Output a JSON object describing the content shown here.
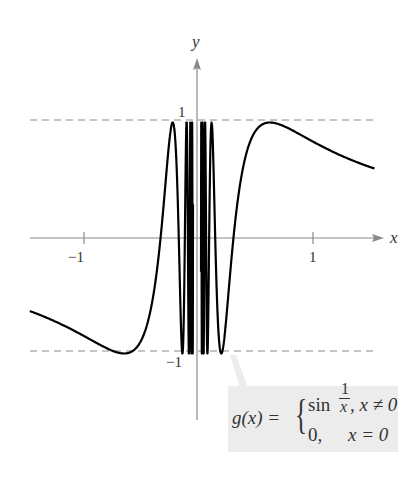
{
  "chart_data": {
    "type": "line",
    "title": "",
    "function": "g(x) = sin(1/x) for x != 0; 0 for x = 0",
    "xlabel": "x",
    "ylabel": "y",
    "xlim": [
      -1.46,
      1.55
    ],
    "ylim": [
      -1.0,
      1.0
    ],
    "x_ticks": [
      -1,
      1
    ],
    "x_tick_labels": [
      "−1",
      "1"
    ],
    "y_ticks": [
      1,
      -1
    ],
    "y_tick_labels": [
      "1",
      "−1"
    ],
    "reference_lines": [
      {
        "y": 1,
        "style": "dashed",
        "color": "#8a8a8a"
      },
      {
        "y": -1,
        "style": "dashed",
        "color": "#8a8a8a"
      }
    ],
    "series": [
      {
        "name": "g(x)",
        "color": "#000000",
        "x_range": [
          -1.46,
          1.55
        ],
        "sample_points": [
          {
            "x": -1.46,
            "y": -0.63
          },
          {
            "x": -1.0,
            "y": -0.84
          },
          {
            "x": -0.64,
            "y": -1.0
          },
          {
            "x": -0.32,
            "y": 0.0
          },
          {
            "x": -0.21,
            "y": 1.0
          },
          {
            "x": -0.16,
            "y": 0.0
          },
          {
            "x": 0.21,
            "y": -1.0
          },
          {
            "x": 0.32,
            "y": 0.0
          },
          {
            "x": 0.64,
            "y": 1.0
          },
          {
            "x": 1.0,
            "y": 0.84
          },
          {
            "x": 1.55,
            "y": 0.6
          }
        ]
      }
    ],
    "grid": false,
    "legend": null,
    "annotation": {
      "text": "g(x) = { sin(1/x), x ≠ 0 ; 0, x = 0 }",
      "position": "bottom-right"
    }
  },
  "axes": {
    "x_label": "x",
    "y_label": "y",
    "tick_neg_one_x": "−1",
    "tick_one_x": "1",
    "tick_one_y": "1",
    "tick_neg_one_y": "−1"
  },
  "formula": {
    "lhs": "g(x) =",
    "case1_func": "sin",
    "case1_num": "1",
    "case1_den": "x",
    "case1_cond": ", x ≠ 0",
    "case2_val": "0,",
    "case2_cond": "x = 0"
  },
  "colors": {
    "axis": "#8a8a8a",
    "curve": "#000000",
    "dash": "#8a8a8a",
    "formula_bg": "#ececec"
  }
}
